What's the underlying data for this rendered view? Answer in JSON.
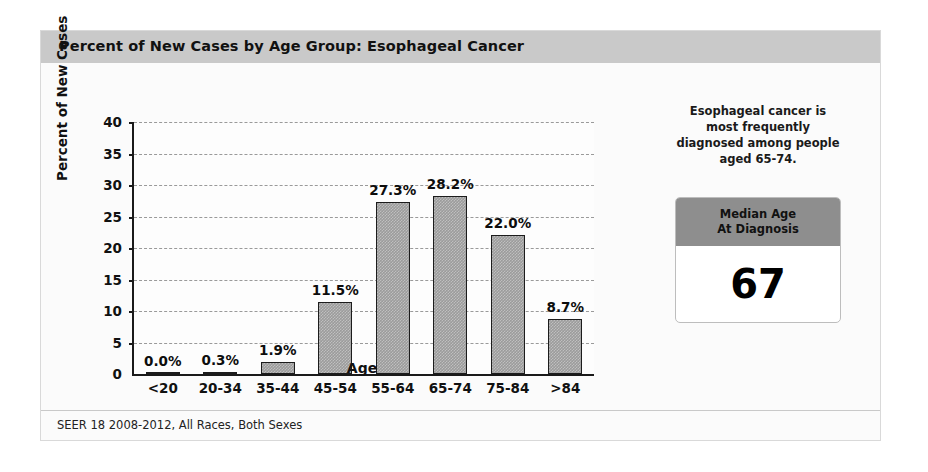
{
  "header": {
    "title": "Percent of New Cases by Age Group: Esophageal Cancer"
  },
  "footer": {
    "source": "SEER 18 2008-2012, All Races, Both Sexes"
  },
  "side_panel": {
    "note_line1": "Esophageal cancer is",
    "note_line2": "most frequently",
    "note_line3": "diagnosed among people",
    "note_line4": "aged 65-74.",
    "median_title_line1": "Median Age",
    "median_title_line2": "At Diagnosis",
    "median_value": "67"
  },
  "colors": {
    "title_band": "#c9c9c9",
    "bar_fill": "#9b9b9b",
    "bar_outline": "#1c1c1c",
    "median_head": "#8e8e8e",
    "card_background": "#fbfbfb"
  },
  "chart_data": {
    "type": "bar",
    "title": "Percent of New Cases by Age Group: Esophageal Cancer",
    "xlabel": "Age",
    "ylabel": "Percent of New Cases",
    "categories": [
      "<20",
      "20-34",
      "35-44",
      "45-54",
      "55-64",
      "65-74",
      "75-84",
      ">84"
    ],
    "values": [
      0.0,
      0.3,
      1.9,
      11.5,
      27.3,
      28.2,
      22.0,
      8.7
    ],
    "data_labels": [
      "0.0%",
      "0.3%",
      "1.9%",
      "11.5%",
      "27.3%",
      "28.2%",
      "22.0%",
      "8.7%"
    ],
    "ylim": [
      0,
      40
    ],
    "yticks": [
      0,
      5,
      10,
      15,
      20,
      25,
      30,
      35,
      40
    ],
    "ytick_labels": [
      "0",
      "5",
      "10",
      "15",
      "20",
      "25",
      "30",
      "35",
      "40"
    ],
    "grid": true,
    "grid_style": "dashed",
    "legend": null
  }
}
